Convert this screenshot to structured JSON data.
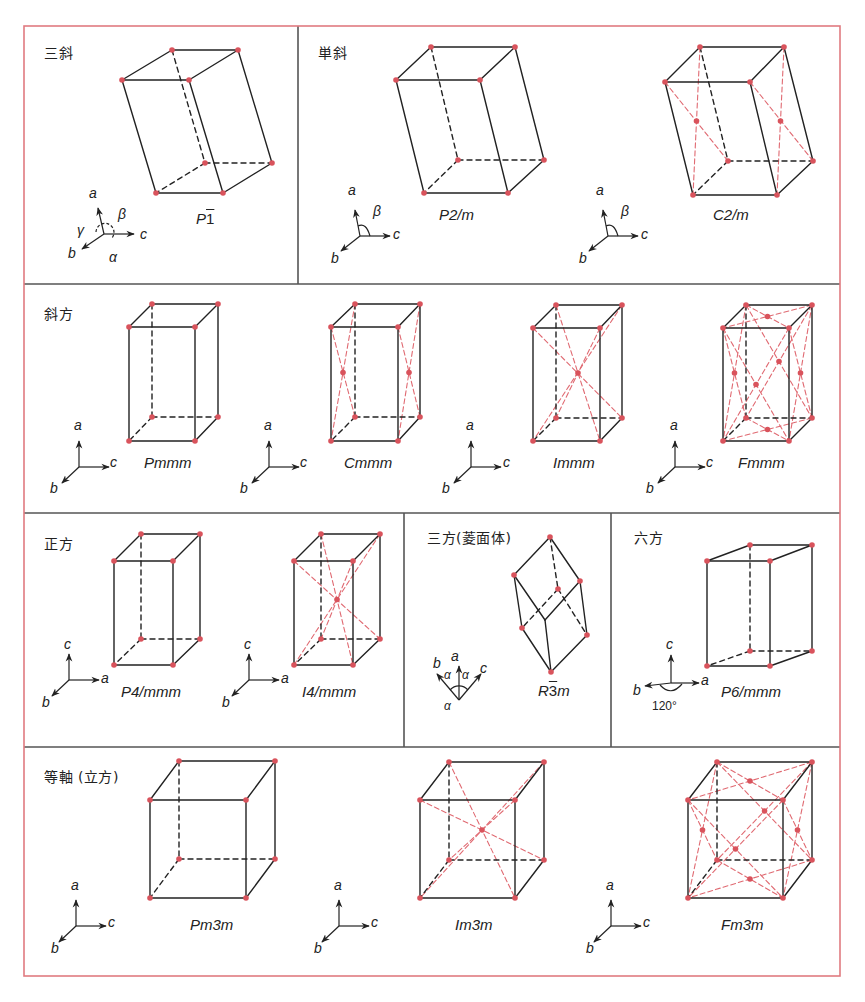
{
  "colors": {
    "frame": "#e07b80",
    "divider": "#555555",
    "edge": "#222222",
    "lattice_point": "#d9535c",
    "center_line": "#e06a72"
  },
  "panels": {
    "triclinic": {
      "label": "三斜",
      "lattices": [
        {
          "symbol_main": "P",
          "symbol_bar": "1",
          "symbol": "P-1"
        }
      ],
      "axes": {
        "a": "a",
        "b": "b",
        "c": "c",
        "alpha": "α",
        "beta": "β",
        "gamma": "γ"
      }
    },
    "monoclinic": {
      "label": "単斜",
      "lattices": [
        {
          "symbol": "P2/m"
        },
        {
          "symbol": "C2/m"
        }
      ],
      "axes": {
        "a": "a",
        "b": "b",
        "c": "c",
        "beta": "β"
      }
    },
    "orthorhombic": {
      "label": "斜方",
      "lattices": [
        {
          "symbol": "Pmmm"
        },
        {
          "symbol": "Cmmm"
        },
        {
          "symbol": "Immm"
        },
        {
          "symbol": "Fmmm"
        }
      ],
      "axes": {
        "a": "a",
        "b": "b",
        "c": "c"
      }
    },
    "tetragonal": {
      "label": "正方",
      "lattices": [
        {
          "symbol": "P4/mmm"
        },
        {
          "symbol": "I4/mmm"
        }
      ],
      "axes": {
        "a": "a",
        "b": "b",
        "c": "c"
      }
    },
    "trigonal": {
      "label": "三方(菱面体)",
      "lattices": [
        {
          "symbol_main": "R",
          "symbol_bar": "3",
          "symbol_tail": "m",
          "symbol": "R-3m"
        }
      ],
      "axes": {
        "a": "a",
        "b": "b",
        "c": "c",
        "alpha": "α"
      }
    },
    "hexagonal": {
      "label": "六方",
      "lattices": [
        {
          "symbol": "P6/mmm"
        }
      ],
      "axes": {
        "a": "a",
        "b": "b",
        "c": "c",
        "angle": "120°"
      }
    },
    "cubic": {
      "label": "等軸 (立方)",
      "lattices": [
        {
          "symbol": "Pm3m"
        },
        {
          "symbol": "Im3m"
        },
        {
          "symbol": "Fm3m"
        }
      ],
      "axes": {
        "a": "a",
        "b": "b",
        "c": "c"
      }
    }
  }
}
